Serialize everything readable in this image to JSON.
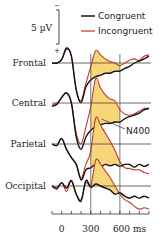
{
  "chart_data": {
    "type": "line",
    "title": "",
    "xlabel": "ms",
    "ylabel": "",
    "x_unit": "ms",
    "xlim": [
      -100,
      900
    ],
    "x_ticks": [
      0,
      300,
      600
    ],
    "x_tick_labels": [
      "0",
      "300",
      "600 ms"
    ],
    "minor_tick_step": 100,
    "polarity": "negative up",
    "scale_bar": {
      "label": "5 µV",
      "value": 5,
      "top_sign": "−",
      "bottom_sign": "+"
    },
    "window_lines": [
      300,
      600
    ],
    "legend": [
      {
        "name": "Congruent",
        "color": "#111111"
      },
      {
        "name": "Incongruent",
        "color": "#c0392b"
      }
    ],
    "fill_color": "#f7d67a",
    "annotation": {
      "text": "N400",
      "site": "Parietal",
      "x": 400
    },
    "x": [
      -100,
      -50,
      0,
      50,
      100,
      150,
      200,
      250,
      300,
      350,
      400,
      450,
      500,
      550,
      600,
      650,
      700,
      750,
      800,
      850,
      900
    ],
    "sites": [
      {
        "name": "Frontal",
        "series": [
          {
            "name": "Congruent",
            "values": [
              0,
              0,
              -0.5,
              -2.2,
              -1.0,
              4.0,
              5.8,
              3.5,
              2.5,
              2.0,
              1.8,
              1.5,
              1.5,
              1.2,
              1.2,
              0.8,
              0.5,
              0.0,
              -0.3,
              -0.6,
              -1.0
            ]
          },
          {
            "name": "Incongruent",
            "values": [
              0,
              0,
              -0.5,
              -2.0,
              -1.0,
              4.0,
              5.5,
              3.0,
              0.5,
              -1.8,
              -1.2,
              -0.6,
              -0.2,
              0.0,
              0.4,
              0.0,
              -0.4,
              -0.6,
              -0.4,
              -1.0,
              -1.2
            ]
          }
        ]
      },
      {
        "name": "Central",
        "series": [
          {
            "name": "Congruent",
            "values": [
              0.5,
              0.2,
              -0.8,
              -1.5,
              0.0,
              5.0,
              6.8,
              5.0,
              4.0,
              3.5,
              3.2,
              3.0,
              3.0,
              2.8,
              2.8,
              2.3,
              2.0,
              1.8,
              1.5,
              1.0,
              0.8
            ]
          },
          {
            "name": "Incongruent",
            "values": [
              0.3,
              0.0,
              -0.8,
              -1.5,
              0.0,
              4.5,
              6.0,
              3.5,
              0.5,
              -3.6,
              -2.2,
              -1.2,
              -0.6,
              -0.3,
              1.0,
              1.6,
              1.8,
              1.6,
              1.2,
              0.8,
              0.8
            ]
          }
        ]
      },
      {
        "name": "Parietal",
        "series": [
          {
            "name": "Congruent",
            "values": [
              0.0,
              0.2,
              -0.8,
              0.8,
              2.0,
              3.0,
              5.3,
              3.8,
              3.5,
              3.0,
              3.4,
              3.0,
              3.2,
              3.0,
              3.3,
              3.0,
              3.0,
              3.4,
              3.0,
              3.3,
              3.0
            ]
          },
          {
            "name": "Incongruent",
            "values": [
              0.0,
              0.2,
              -0.8,
              0.8,
              2.0,
              3.0,
              5.0,
              3.0,
              1.0,
              -3.8,
              -2.8,
              -1.6,
              -0.4,
              1.0,
              2.6,
              3.5,
              3.6,
              3.8,
              3.8,
              4.2,
              4.4
            ]
          }
        ]
      },
      {
        "name": "Occipital",
        "series": [
          {
            "name": "Congruent",
            "values": [
              0.0,
              0.3,
              -0.5,
              0.3,
              -0.8,
              1.2,
              2.2,
              -0.8,
              0.2,
              -0.3,
              0.0,
              0.3,
              0.6,
              1.2,
              1.0,
              1.5,
              1.8,
              1.5,
              1.8,
              1.5,
              1.8
            ]
          },
          {
            "name": "Incongruent",
            "values": [
              0.0,
              0.5,
              -0.5,
              0.8,
              -0.8,
              1.2,
              2.0,
              -0.5,
              0.0,
              -3.8,
              -3.2,
              -2.2,
              -1.2,
              0.0,
              1.2,
              2.0,
              2.4,
              3.0,
              3.4,
              3.2,
              3.4
            ]
          }
        ]
      }
    ]
  }
}
